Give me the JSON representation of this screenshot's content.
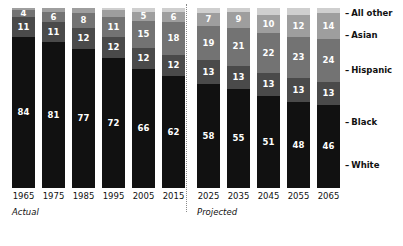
{
  "chart_data": {
    "type": "bar",
    "subtype": "stacked-bar-100-percent",
    "title": "",
    "subtitle": "",
    "xlabel": "",
    "ylabel": "",
    "ylim": [
      0,
      100
    ],
    "grid": false,
    "legend_position": "right",
    "stack_order_bottom_to_top": [
      "White",
      "Black",
      "Hispanic",
      "Asian",
      "All other"
    ],
    "categories": [
      "1965",
      "1975",
      "1985",
      "1995",
      "2005",
      "2015",
      "2025",
      "2035",
      "2045",
      "2055",
      "2065"
    ],
    "series": [
      {
        "name": "White",
        "color": "#111111",
        "values": [
          84,
          81,
          77,
          72,
          66,
          62,
          58,
          55,
          51,
          48,
          46
        ]
      },
      {
        "name": "Black",
        "color": "#4a4a4a",
        "values": [
          11,
          11,
          12,
          12,
          12,
          12,
          13,
          13,
          13,
          13,
          13
        ]
      },
      {
        "name": "Hispanic",
        "color": "#737373",
        "values": [
          4,
          6,
          8,
          11,
          15,
          18,
          19,
          21,
          22,
          23,
          24
        ]
      },
      {
        "name": "Asian",
        "color": "#9e9e9e",
        "values": [
          1,
          2,
          3,
          4,
          5,
          6,
          7,
          9,
          10,
          12,
          14
        ]
      },
      {
        "name": "All other",
        "color": "#cfcfcf",
        "values": [
          0,
          0,
          0,
          1,
          2,
          2,
          3,
          2,
          4,
          4,
          3
        ]
      }
    ],
    "annotations": [
      {
        "text": "Actual",
        "group": "1965-2015"
      },
      {
        "text": "Projected",
        "group": "2025-2065"
      }
    ]
  },
  "groups": [
    {
      "id": "actual",
      "caption": "Actual",
      "bars": [
        {
          "year": "1965",
          "segments": [
            {
              "series": "White",
              "value": 84,
              "label": "84",
              "show_label": true,
              "color": "#111111"
            },
            {
              "series": "Black",
              "value": 11,
              "label": "11",
              "show_label": true,
              "color": "#4a4a4a"
            },
            {
              "series": "Hispanic",
              "value": 4,
              "label": "4",
              "show_label": true,
              "color": "#737373"
            },
            {
              "series": "Asian",
              "value": 1,
              "label": "",
              "show_label": false,
              "color": "#9e9e9e"
            }
          ]
        },
        {
          "year": "1975",
          "segments": [
            {
              "series": "White",
              "value": 81,
              "label": "81",
              "show_label": true,
              "color": "#111111"
            },
            {
              "series": "Black",
              "value": 11,
              "label": "11",
              "show_label": true,
              "color": "#4a4a4a"
            },
            {
              "series": "Hispanic",
              "value": 6,
              "label": "6",
              "show_label": true,
              "color": "#737373"
            },
            {
              "series": "Asian",
              "value": 2,
              "label": "",
              "show_label": false,
              "color": "#9e9e9e"
            }
          ]
        },
        {
          "year": "1985",
          "segments": [
            {
              "series": "White",
              "value": 77,
              "label": "77",
              "show_label": true,
              "color": "#111111"
            },
            {
              "series": "Black",
              "value": 12,
              "label": "12",
              "show_label": true,
              "color": "#4a4a4a"
            },
            {
              "series": "Hispanic",
              "value": 8,
              "label": "8",
              "show_label": true,
              "color": "#737373"
            },
            {
              "series": "Asian",
              "value": 3,
              "label": "",
              "show_label": false,
              "color": "#9e9e9e"
            }
          ]
        },
        {
          "year": "1995",
          "segments": [
            {
              "series": "White",
              "value": 72,
              "label": "72",
              "show_label": true,
              "color": "#111111"
            },
            {
              "series": "Black",
              "value": 12,
              "label": "12",
              "show_label": true,
              "color": "#4a4a4a"
            },
            {
              "series": "Hispanic",
              "value": 11,
              "label": "11",
              "show_label": true,
              "color": "#737373"
            },
            {
              "series": "Asian",
              "value": 4,
              "label": "",
              "show_label": false,
              "color": "#9e9e9e"
            },
            {
              "series": "All other",
              "value": 1,
              "label": "",
              "show_label": false,
              "color": "#cfcfcf"
            }
          ]
        },
        {
          "year": "2005",
          "segments": [
            {
              "series": "White",
              "value": 66,
              "label": "66",
              "show_label": true,
              "color": "#111111"
            },
            {
              "series": "Black",
              "value": 12,
              "label": "12",
              "show_label": true,
              "color": "#4a4a4a"
            },
            {
              "series": "Hispanic",
              "value": 15,
              "label": "15",
              "show_label": true,
              "color": "#737373"
            },
            {
              "series": "Asian",
              "value": 5,
              "label": "5",
              "show_label": true,
              "color": "#9e9e9e"
            },
            {
              "series": "All other",
              "value": 2,
              "label": "",
              "show_label": false,
              "color": "#cfcfcf"
            }
          ]
        },
        {
          "year": "2015",
          "segments": [
            {
              "series": "White",
              "value": 62,
              "label": "62",
              "show_label": true,
              "color": "#111111"
            },
            {
              "series": "Black",
              "value": 12,
              "label": "12",
              "show_label": true,
              "color": "#4a4a4a"
            },
            {
              "series": "Hispanic",
              "value": 18,
              "label": "18",
              "show_label": true,
              "color": "#737373"
            },
            {
              "series": "Asian",
              "value": 6,
              "label": "6",
              "show_label": true,
              "color": "#9e9e9e"
            },
            {
              "series": "All other",
              "value": 2,
              "label": "",
              "show_label": false,
              "color": "#cfcfcf"
            }
          ]
        }
      ]
    },
    {
      "id": "projected",
      "caption": "Projected",
      "bars": [
        {
          "year": "2025",
          "segments": [
            {
              "series": "White",
              "value": 58,
              "label": "58",
              "show_label": true,
              "color": "#111111"
            },
            {
              "series": "Black",
              "value": 13,
              "label": "13",
              "show_label": true,
              "color": "#4a4a4a"
            },
            {
              "series": "Hispanic",
              "value": 19,
              "label": "19",
              "show_label": true,
              "color": "#737373"
            },
            {
              "series": "Asian",
              "value": 7,
              "label": "7",
              "show_label": true,
              "color": "#9e9e9e"
            },
            {
              "series": "All other",
              "value": 3,
              "label": "",
              "show_label": false,
              "color": "#cfcfcf"
            }
          ]
        },
        {
          "year": "2035",
          "segments": [
            {
              "series": "White",
              "value": 55,
              "label": "55",
              "show_label": true,
              "color": "#111111"
            },
            {
              "series": "Black",
              "value": 13,
              "label": "13",
              "show_label": true,
              "color": "#4a4a4a"
            },
            {
              "series": "Hispanic",
              "value": 21,
              "label": "21",
              "show_label": true,
              "color": "#737373"
            },
            {
              "series": "Asian",
              "value": 9,
              "label": "9",
              "show_label": true,
              "color": "#9e9e9e"
            },
            {
              "series": "All other",
              "value": 2,
              "label": "",
              "show_label": false,
              "color": "#cfcfcf"
            }
          ]
        },
        {
          "year": "2045",
          "segments": [
            {
              "series": "White",
              "value": 51,
              "label": "51",
              "show_label": true,
              "color": "#111111"
            },
            {
              "series": "Black",
              "value": 13,
              "label": "13",
              "show_label": true,
              "color": "#4a4a4a"
            },
            {
              "series": "Hispanic",
              "value": 22,
              "label": "22",
              "show_label": true,
              "color": "#737373"
            },
            {
              "series": "Asian",
              "value": 10,
              "label": "10",
              "show_label": true,
              "color": "#9e9e9e"
            },
            {
              "series": "All other",
              "value": 4,
              "label": "",
              "show_label": false,
              "color": "#cfcfcf"
            }
          ]
        },
        {
          "year": "2055",
          "segments": [
            {
              "series": "White",
              "value": 48,
              "label": "48",
              "show_label": true,
              "color": "#111111"
            },
            {
              "series": "Black",
              "value": 13,
              "label": "13",
              "show_label": true,
              "color": "#4a4a4a"
            },
            {
              "series": "Hispanic",
              "value": 23,
              "label": "23",
              "show_label": true,
              "color": "#737373"
            },
            {
              "series": "Asian",
              "value": 12,
              "label": "12",
              "show_label": true,
              "color": "#9e9e9e"
            },
            {
              "series": "All other",
              "value": 4,
              "label": "",
              "show_label": false,
              "color": "#cfcfcf"
            }
          ]
        },
        {
          "year": "2065",
          "segments": [
            {
              "series": "White",
              "value": 46,
              "label": "46",
              "show_label": true,
              "color": "#111111"
            },
            {
              "series": "Black",
              "value": 13,
              "label": "13",
              "show_label": true,
              "color": "#4a4a4a"
            },
            {
              "series": "Hispanic",
              "value": 24,
              "label": "24",
              "show_label": true,
              "color": "#737373"
            },
            {
              "series": "Asian",
              "value": 14,
              "label": "14",
              "show_label": true,
              "color": "#9e9e9e"
            },
            {
              "series": "All other",
              "value": 3,
              "label": "",
              "show_label": false,
              "color": "#cfcfcf"
            }
          ]
        }
      ]
    }
  ],
  "legend": {
    "dash": "–",
    "items": [
      {
        "label": "All other",
        "color": "#cfcfcf",
        "top": 8
      },
      {
        "label": "Asian",
        "color": "#9e9e9e",
        "top": 30
      },
      {
        "label": "Hispanic",
        "color": "#737373",
        "top": 65
      },
      {
        "label": "Black",
        "color": "#4a4a4a",
        "top": 117
      },
      {
        "label": "White",
        "color": "#111111",
        "top": 160
      }
    ]
  }
}
